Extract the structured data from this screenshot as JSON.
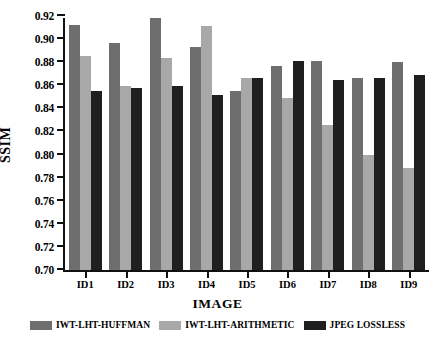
{
  "caption_remnant": "",
  "axis": {
    "ylabel": "SSIM",
    "xlabel": "IMAGE",
    "yticks": [
      "0.70",
      "0.72",
      "0.74",
      "0.76",
      "0.78",
      "0.80",
      "0.82",
      "0.84",
      "0.86",
      "0.88",
      "0.90",
      "0.92"
    ]
  },
  "legend": [
    {
      "label": "IWT-LHT-HUFFMAN",
      "color": "#6e6e6e"
    },
    {
      "label": "IWT-LHT-ARITHMETIC",
      "color": "#a8a8a8"
    },
    {
      "label": "JPEG LOSSLESS",
      "color": "#1f1f1f"
    }
  ],
  "chart_data": {
    "type": "bar",
    "title": "",
    "xlabel": "IMAGE",
    "ylabel": "SSIM",
    "ylim": [
      0.7,
      0.92
    ],
    "ytick_step": 0.02,
    "grid": false,
    "legend_position": "below-axis",
    "categories": [
      "ID1",
      "ID2",
      "ID3",
      "ID4",
      "ID5",
      "ID6",
      "ID7",
      "ID8",
      "ID9"
    ],
    "series": [
      {
        "name": "IWT-LHT-HUFFMAN",
        "color": "#6e6e6e",
        "values": [
          0.912,
          0.897,
          0.918,
          0.893,
          0.855,
          0.877,
          0.881,
          0.866,
          0.88
        ]
      },
      {
        "name": "IWT-LHT-ARITHMETIC",
        "color": "#a8a8a8",
        "values": [
          0.885,
          0.859,
          0.884,
          0.911,
          0.866,
          0.849,
          0.826,
          0.8,
          0.788
        ]
      },
      {
        "name": "JPEG LOSSLESS",
        "color": "#1f1f1f",
        "values": [
          0.855,
          0.858,
          0.859,
          0.852,
          0.866,
          0.881,
          0.865,
          0.866,
          0.869
        ]
      }
    ]
  }
}
